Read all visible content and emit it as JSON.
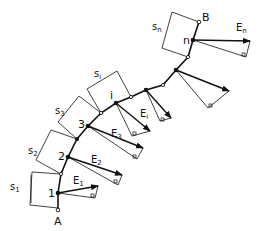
{
  "diagram": {
    "type": "segmented-curve-vector-diagram",
    "colors": {
      "ink": "#111111",
      "background": "#ffffff"
    },
    "endpoints": {
      "start": "A",
      "end": "B"
    },
    "nodes": [
      {
        "label": "1",
        "x": 58,
        "y": 193
      },
      {
        "label": "2",
        "x": 68,
        "y": 157
      },
      {
        "label": "3",
        "x": 88,
        "y": 126
      },
      {
        "label": "i",
        "x": 116,
        "y": 103
      },
      {
        "label": "n",
        "x": 193,
        "y": 40
      }
    ],
    "segment_labels": [
      "s1",
      "s2",
      "s3",
      "si",
      "sn"
    ],
    "vector_labels": [
      "E1",
      "E2",
      "E3",
      "Ei",
      "En"
    ],
    "labels": {
      "A": "A",
      "B": "B",
      "n1": "1",
      "n2": "2",
      "n3": "3",
      "ni": "i",
      "nn": "n",
      "s1": "s",
      "s1sub": "1",
      "s2": "s",
      "s2sub": "2",
      "s3": "s",
      "s3sub": "3",
      "si": "s",
      "sisub": "i",
      "sn": "s",
      "snsub": "n",
      "E1": "E",
      "E1sub": "1",
      "E2": "E",
      "E2sub": "2",
      "E3": "E",
      "E3sub": "3",
      "Ei": "E",
      "Eisub": "i",
      "En": "E",
      "Ensub": "n"
    }
  }
}
